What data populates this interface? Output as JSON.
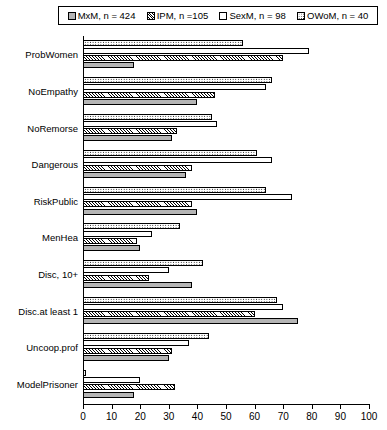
{
  "legend": {
    "items": [
      {
        "label": "MxM, n = 424",
        "pattern": "f-mxm",
        "key": "MxM"
      },
      {
        "label": "IPM, n =105",
        "pattern": "f-ipm",
        "key": "IPM"
      },
      {
        "label": "SexM, n = 98",
        "pattern": "f-sexm",
        "key": "SexM"
      },
      {
        "label": "OWoM, n = 40",
        "pattern": "f-owom",
        "key": "OWoM"
      }
    ]
  },
  "chart_data": {
    "type": "bar",
    "orientation": "horizontal",
    "title": "",
    "xlabel": "",
    "ylabel": "",
    "xlim": [
      0,
      100
    ],
    "xticks": [
      0,
      10,
      20,
      30,
      40,
      50,
      60,
      70,
      80,
      90,
      100
    ],
    "grid": false,
    "legend_position": "top",
    "categories": [
      "ProbWomen",
      "NoEmpathy",
      "NoRemorse",
      "Dangerous",
      "RiskPublic",
      "MenHea",
      "Disc, 10+",
      "Disc.at least 1",
      "Uncoop.prof",
      "ModelPrisoner"
    ],
    "series": [
      {
        "name": "OWoM, n = 40",
        "key": "OWoM",
        "pattern": "f-owom",
        "values": [
          56,
          66,
          45,
          61,
          64,
          34,
          42,
          68,
          44,
          1
        ]
      },
      {
        "name": "SexM, n = 98",
        "key": "SexM",
        "pattern": "f-sexm",
        "values": [
          79,
          64,
          47,
          66,
          73,
          24,
          30,
          70,
          37,
          20
        ]
      },
      {
        "name": "IPM, n =105",
        "key": "IPM",
        "pattern": "f-ipm",
        "values": [
          70,
          46,
          33,
          38,
          38,
          19,
          23,
          60,
          31,
          32
        ]
      },
      {
        "name": "MxM, n = 424",
        "key": "MxM",
        "pattern": "f-mxm",
        "values": [
          18,
          40,
          31,
          36,
          40,
          20,
          38,
          75,
          30,
          18
        ]
      }
    ]
  }
}
